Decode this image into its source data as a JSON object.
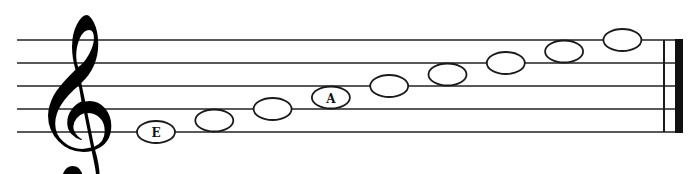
{
  "diagram": {
    "clef": "treble",
    "clef_glyph": "𝄞",
    "staff_lines": 5,
    "barline": "final",
    "notes": [
      {
        "pitch": "E4",
        "step": 0,
        "label": "E",
        "type": "whole"
      },
      {
        "pitch": "F4",
        "step": 1,
        "label": "",
        "type": "whole"
      },
      {
        "pitch": "G4",
        "step": 2,
        "label": "",
        "type": "whole"
      },
      {
        "pitch": "A4",
        "step": 3,
        "label": "A",
        "type": "whole"
      },
      {
        "pitch": "B4",
        "step": 4,
        "label": "",
        "type": "whole"
      },
      {
        "pitch": "C5",
        "step": 5,
        "label": "",
        "type": "whole"
      },
      {
        "pitch": "D5",
        "step": 6,
        "label": "",
        "type": "whole"
      },
      {
        "pitch": "E5",
        "step": 7,
        "label": "",
        "type": "whole"
      },
      {
        "pitch": "F5",
        "step": 8,
        "label": "",
        "type": "whole"
      }
    ]
  }
}
